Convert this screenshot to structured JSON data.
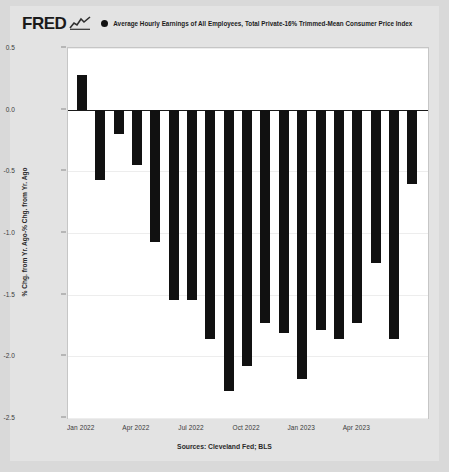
{
  "brand": {
    "logo_text": "FRED",
    "logo_icon": "squiggle-chart-icon"
  },
  "legend": {
    "marker_icon": "legend-dot-icon",
    "series_label": "Average Hourly Earnings of All Employees, Total Private-16% Trimmed-Mean Consumer Price Index"
  },
  "footer": {
    "sources": "Sources: Cleveland Fed; BLS"
  },
  "axes": {
    "y_label": "% Chg. from Yr. Ago-% Chg. from Yr. Ago",
    "y_ticks": [
      "0.5",
      "0.0",
      "-0.5",
      "-1.0",
      "-1.5",
      "-2.0",
      "-2.5"
    ],
    "y_tick_values": [
      0.5,
      0.0,
      -0.5,
      -1.0,
      -1.5,
      -2.0,
      -2.5
    ],
    "x_ticks": [
      "Jan 2022",
      "Apr 2022",
      "Jul 2022",
      "Oct 2022",
      "Jan 2023",
      "Apr 2023"
    ],
    "x_tick_index": [
      0,
      3,
      6,
      9,
      12,
      15
    ]
  },
  "colors": {
    "bar": "#111111",
    "zero_line": "#1a1a1a",
    "grid": "#ededed",
    "plot_bg": "#ffffff",
    "card_bg": "#e3e3e3",
    "outer_bg": "#d9d9d9"
  },
  "chart_data": {
    "type": "bar",
    "title": "Average Hourly Earnings of All Employees, Total Private-16% Trimmed-Mean Consumer Price Index",
    "xlabel": "",
    "ylabel": "% Chg. from Yr. Ago-% Chg. from Yr. Ago",
    "ylim": [
      -2.5,
      0.5
    ],
    "grid": true,
    "legend_position": "top",
    "categories": [
      "Jan 2022",
      "Feb 2022",
      "Mar 2022",
      "Apr 2022",
      "May 2022",
      "Jun 2022",
      "Jul 2022",
      "Aug 2022",
      "Sep 2022",
      "Oct 2022",
      "Nov 2022",
      "Dec 2022",
      "Jan 2023",
      "Feb 2023",
      "Mar 2023",
      "Apr 2023",
      "May 2023",
      "Jun 2023",
      "Jul 2023"
    ],
    "values": [
      0.28,
      -0.57,
      -0.2,
      -0.45,
      -1.07,
      -1.54,
      -1.54,
      -1.86,
      -2.28,
      -2.08,
      -1.73,
      -1.81,
      -2.18,
      -1.79,
      -1.86,
      -1.73,
      -1.24,
      -1.86,
      -0.6
    ]
  }
}
